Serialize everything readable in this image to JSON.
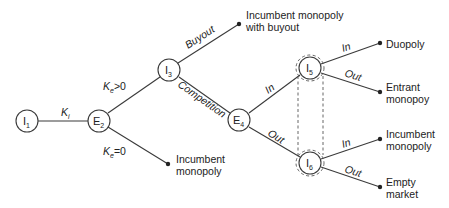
{
  "diagram": {
    "type": "game-tree",
    "nodes": [
      {
        "id": "I1",
        "letter": "I",
        "sub": "1"
      },
      {
        "id": "E2",
        "letter": "E",
        "sub": "2"
      },
      {
        "id": "I3",
        "letter": "I",
        "sub": "3"
      },
      {
        "id": "E4",
        "letter": "E",
        "sub": "4"
      },
      {
        "id": "I5",
        "letter": "I",
        "sub": "5"
      },
      {
        "id": "I6",
        "letter": "I",
        "sub": "6"
      }
    ],
    "edges": [
      {
        "from": "I1",
        "to": "E2",
        "label": "K",
        "label_sub": "i"
      },
      {
        "from": "E2",
        "to": "I3",
        "label": "K",
        "label_sub": "e",
        "label_suffix": ">0"
      },
      {
        "from": "E2",
        "to": "outcome-incumbent-monopoly-1",
        "label": "K",
        "label_sub": "e",
        "label_suffix": "=0"
      },
      {
        "from": "I3",
        "to": "outcome-buyout",
        "label": "Buyout"
      },
      {
        "from": "I3",
        "to": "E4",
        "label": "Competition"
      },
      {
        "from": "E4",
        "to": "I5",
        "label": "In"
      },
      {
        "from": "E4",
        "to": "I6",
        "label": "Out"
      },
      {
        "from": "I5",
        "to": "outcome-duopoly",
        "label": "In"
      },
      {
        "from": "I5",
        "to": "outcome-entrant-monopoly",
        "label": "Out"
      },
      {
        "from": "I6",
        "to": "outcome-incumbent-monopoly-2",
        "label": "In"
      },
      {
        "from": "I6",
        "to": "outcome-empty-market",
        "label": "Out"
      }
    ],
    "outcomes": {
      "buyout": [
        "Incumbent monopoly",
        "with buyout"
      ],
      "incumbent_monopoly_1": [
        "Incumbent",
        "monopoly"
      ],
      "duopoly": [
        "Duopoly"
      ],
      "entrant_monopoly": [
        "Entrant",
        "monopoy"
      ],
      "incumbent_monopoly_2": [
        "Incumbent",
        "monopoly"
      ],
      "empty_market": [
        "Empty",
        "market"
      ]
    },
    "information_set": [
      "I5",
      "I6"
    ]
  }
}
